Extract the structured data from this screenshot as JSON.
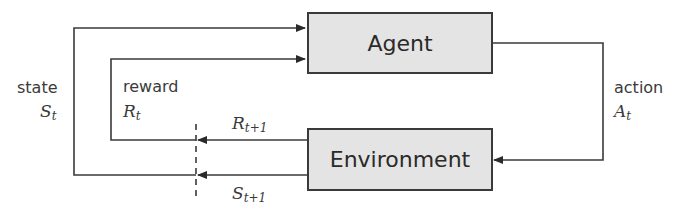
{
  "diagram": {
    "type": "reinforcement-learning-loop",
    "nodes": {
      "agent": {
        "label": "Agent"
      },
      "environment": {
        "label": "Environment"
      }
    },
    "edges": {
      "action": {
        "label": "action",
        "symbol": "A",
        "subscript": "t"
      },
      "state": {
        "label": "state",
        "symbol": "S",
        "subscript": "t"
      },
      "reward": {
        "label": "reward",
        "symbol": "R",
        "subscript": "t"
      },
      "next_reward": {
        "symbol": "R",
        "subscript": "t+1"
      },
      "next_state": {
        "symbol": "S",
        "subscript": "t+1"
      }
    },
    "colors": {
      "box_fill": "#e4e4e4",
      "line": "#3a3a3a",
      "text": "#3a3a3a"
    }
  }
}
